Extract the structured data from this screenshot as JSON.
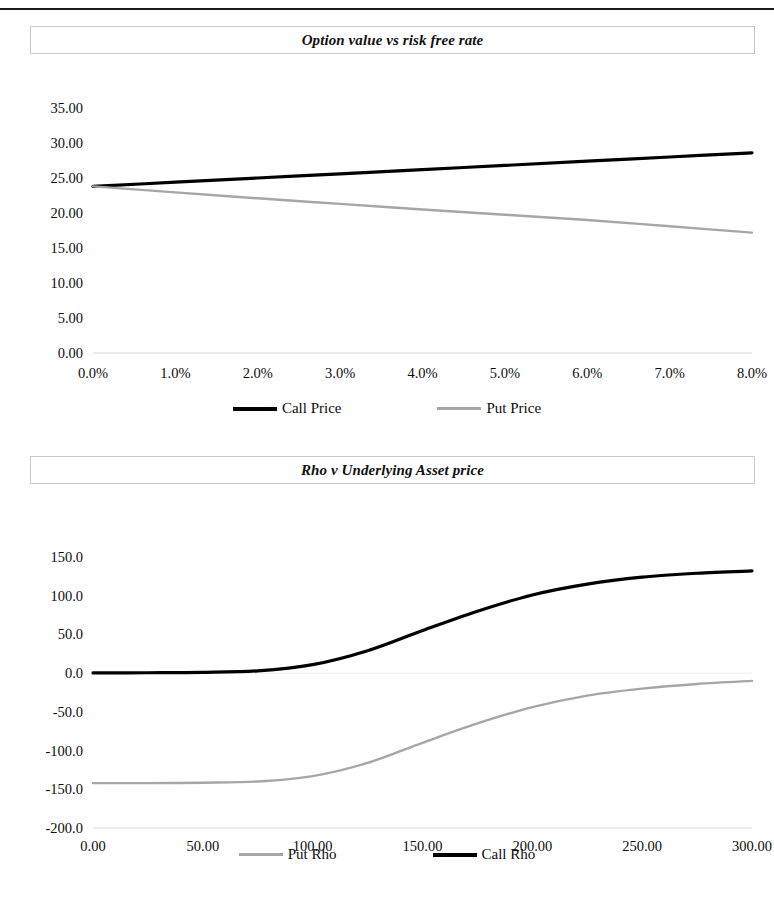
{
  "page": {
    "background_color": "#ffffff",
    "top_rule": true
  },
  "colors": {
    "call_series": "#000000",
    "put_series": "#a6a6a6",
    "axis_line": "#d9d9d9",
    "title_border": "#c9c9c9",
    "text": "#0d0d0d"
  },
  "charts": [
    {
      "id": "chart-one",
      "title": "Option value vs risk free rate",
      "legend": [
        {
          "label": "Call Price",
          "color": "#000000",
          "weight": "thick"
        },
        {
          "label": "Put Price",
          "color": "#a6a6a6",
          "weight": "thin"
        }
      ],
      "yticks": [
        "35.00",
        "30.00",
        "25.00",
        "20.00",
        "15.00",
        "10.00",
        "5.00",
        "0.00"
      ],
      "xticks": [
        "0.0%",
        "1.0%",
        "2.0%",
        "3.0%",
        "4.0%",
        "5.0%",
        "6.0%",
        "7.0%",
        "8.0%"
      ]
    },
    {
      "id": "chart-two",
      "title": "Rho v Underlying Asset price",
      "legend": [
        {
          "label": "Put Rho",
          "color": "#a6a6a6",
          "weight": "thin"
        },
        {
          "label": "Call Rho",
          "color": "#000000",
          "weight": "thick"
        }
      ],
      "yticks": [
        "150.0",
        "100.0",
        "50.0",
        "0.0",
        "-50.0",
        "-100.0",
        "-150.0",
        "-200.0"
      ],
      "xticks": [
        "0.00",
        "50.00",
        "100.00",
        "150.00",
        "200.00",
        "250.00",
        "300.00"
      ]
    }
  ],
  "chart_data": [
    {
      "type": "line",
      "title": "Option value vs risk free rate",
      "xlabel": "",
      "ylabel": "",
      "xlim": [
        0.0,
        0.08
      ],
      "ylim": [
        0.0,
        35.0
      ],
      "grid": false,
      "legend_position": "bottom",
      "xtick_labels": [
        "0.0%",
        "1.0%",
        "2.0%",
        "3.0%",
        "4.0%",
        "5.0%",
        "6.0%",
        "7.0%",
        "8.0%"
      ],
      "ytick_labels": [
        "0.00",
        "5.00",
        "10.00",
        "15.00",
        "20.00",
        "25.00",
        "30.00",
        "35.00"
      ],
      "x": [
        0.0,
        0.01,
        0.02,
        0.03,
        0.04,
        0.05,
        0.06,
        0.07,
        0.08
      ],
      "series": [
        {
          "name": "Call Price",
          "color": "#000000",
          "values": [
            23.8,
            24.4,
            25.0,
            25.6,
            26.2,
            26.8,
            27.4,
            28.0,
            28.6
          ]
        },
        {
          "name": "Put Price",
          "color": "#a6a6a6",
          "values": [
            23.8,
            22.95,
            22.1,
            21.3,
            20.5,
            19.75,
            19.0,
            18.1,
            17.2
          ]
        }
      ]
    },
    {
      "type": "line",
      "title": "Rho v Underlying Asset price",
      "xlabel": "",
      "ylabel": "",
      "xlim": [
        0.0,
        300.0
      ],
      "ylim": [
        -200.0,
        150.0
      ],
      "grid": false,
      "legend_position": "bottom",
      "xtick_labels": [
        "0.00",
        "50.00",
        "100.00",
        "150.00",
        "200.00",
        "250.00",
        "300.00"
      ],
      "ytick_labels": [
        "-200.0",
        "-150.0",
        "-100.0",
        "-50.0",
        "0.0",
        "50.0",
        "100.0",
        "150.0"
      ],
      "x": [
        0,
        25,
        50,
        75,
        100,
        125,
        150,
        175,
        200,
        225,
        250,
        275,
        300
      ],
      "series": [
        {
          "name": "Call Rho",
          "color": "#000000",
          "values": [
            0.3,
            0.5,
            1.0,
            3.0,
            11.0,
            29.0,
            55.0,
            80.0,
            101.0,
            115.0,
            124.0,
            129.0,
            132.0
          ]
        },
        {
          "name": "Put Rho",
          "color": "#a6a6a6",
          "values": [
            -142.0,
            -142.0,
            -141.5,
            -140.0,
            -133.0,
            -116.0,
            -90.0,
            -65.0,
            -44.0,
            -29.0,
            -20.0,
            -14.0,
            -10.0
          ]
        }
      ]
    }
  ]
}
